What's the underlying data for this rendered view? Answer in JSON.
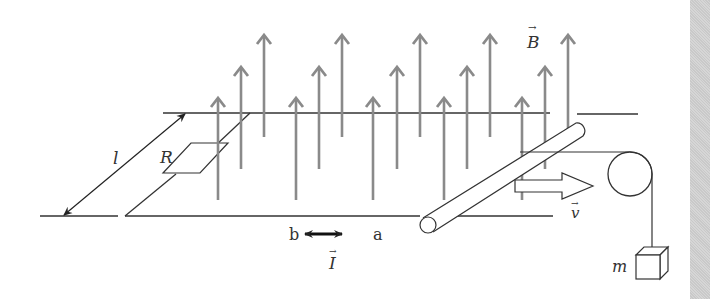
{
  "diagram": {
    "type": "physics-induction-rail",
    "labels": {
      "magnetic_field": "B",
      "length": "l",
      "resistor": "R",
      "velocity": "v",
      "current": "I",
      "point_b": "b",
      "point_a": "a",
      "mass": "m",
      "vector_arrow": "→"
    },
    "colors": {
      "field_arrow": "#8a8a8a",
      "line": "#333333",
      "current_arrow": "#111111",
      "side_strip": "#d0d0d0",
      "background": "#ffffff"
    },
    "field_arrows": [
      {
        "x": 218,
        "tip": 98,
        "bottom": 200
      },
      {
        "x": 241,
        "tip": 67,
        "bottom": 169
      },
      {
        "x": 264,
        "tip": 35,
        "bottom": 137
      },
      {
        "x": 296,
        "tip": 98,
        "bottom": 200
      },
      {
        "x": 319,
        "tip": 67,
        "bottom": 169
      },
      {
        "x": 342,
        "tip": 35,
        "bottom": 137
      },
      {
        "x": 373,
        "tip": 98,
        "bottom": 200
      },
      {
        "x": 397,
        "tip": 67,
        "bottom": 169
      },
      {
        "x": 420,
        "tip": 35,
        "bottom": 137
      },
      {
        "x": 444,
        "tip": 98,
        "bottom": 200
      },
      {
        "x": 467,
        "tip": 67,
        "bottom": 169
      },
      {
        "x": 490,
        "tip": 35,
        "bottom": 137
      },
      {
        "x": 522,
        "tip": 98,
        "bottom": 200
      },
      {
        "x": 545,
        "tip": 67,
        "bottom": 169
      },
      {
        "x": 568,
        "tip": 35,
        "bottom": 137
      }
    ]
  }
}
